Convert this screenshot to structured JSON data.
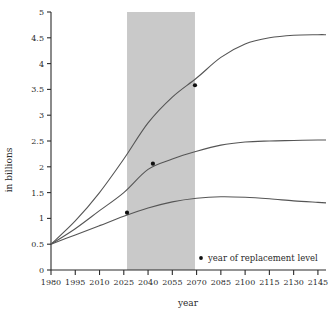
{
  "chart_data": {
    "type": "line",
    "title": "",
    "xlabel": "year",
    "ylabel": "in billions",
    "xlim": [
      1980,
      2150
    ],
    "ylim": [
      0,
      5
    ],
    "grid": false,
    "legend_position": "bottom-right",
    "xticks": [
      1980,
      1995,
      2010,
      2025,
      2040,
      2055,
      2070,
      2085,
      2100,
      2115,
      2130,
      2145
    ],
    "yticks": [
      0,
      0.5,
      1,
      1.5,
      2,
      2.5,
      3,
      3.5,
      4,
      4.5,
      5
    ],
    "shaded_band": {
      "label": "projection band",
      "x_start": 2027,
      "x_end": 2069,
      "color": "#c9c9c9"
    },
    "series": [
      {
        "name": "high",
        "color": "#555555",
        "x": [
          1980,
          1995,
          2010,
          2025,
          2040,
          2055,
          2070,
          2085,
          2100,
          2115,
          2130,
          2145,
          2150
        ],
        "values": [
          0.5,
          0.95,
          1.5,
          2.15,
          2.85,
          3.35,
          3.72,
          4.12,
          4.38,
          4.5,
          4.55,
          4.56,
          4.56
        ]
      },
      {
        "name": "medium",
        "color": "#555555",
        "x": [
          1980,
          1995,
          2010,
          2025,
          2040,
          2055,
          2070,
          2085,
          2100,
          2115,
          2130,
          2145,
          2150
        ],
        "values": [
          0.5,
          0.8,
          1.15,
          1.5,
          1.95,
          2.15,
          2.3,
          2.42,
          2.48,
          2.5,
          2.51,
          2.52,
          2.52
        ]
      },
      {
        "name": "low",
        "color": "#555555",
        "x": [
          1980,
          1995,
          2010,
          2025,
          2040,
          2055,
          2070,
          2085,
          2100,
          2115,
          2130,
          2145,
          2150
        ],
        "values": [
          0.5,
          0.68,
          0.86,
          1.04,
          1.2,
          1.32,
          1.39,
          1.42,
          1.41,
          1.38,
          1.34,
          1.31,
          1.3
        ]
      }
    ],
    "markers": {
      "label": "year of replacement level",
      "color": "#111111",
      "points": [
        {
          "series": "high",
          "x": 2069,
          "y": 3.58
        },
        {
          "series": "medium",
          "x": 2043,
          "y": 2.06
        },
        {
          "series": "low",
          "x": 2027,
          "y": 1.11
        }
      ]
    }
  },
  "legend": {
    "marker_label": "year of replacement level"
  }
}
